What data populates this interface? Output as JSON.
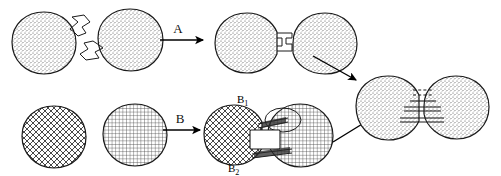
{
  "figure": {
    "background_color": "#ffffff",
    "ink_color": "#1a1a1a",
    "width": 501,
    "height": 176
  },
  "reactions": [
    {
      "id": "reaction-a",
      "arrow_label": "A",
      "row": "top",
      "reactant_left": {
        "name": "stippled-sphere-with-tab",
        "fill_pattern": "stipple",
        "appendage": "protruding-step-tab-upper-right"
      },
      "reactant_right": {
        "name": "stippled-sphere-with-tab",
        "fill_pattern": "stipple",
        "appendage": "protruding-step-tab-lower-left"
      },
      "product": {
        "name": "stippled-dimer-interlocked",
        "fill_pattern": "stipple",
        "junction": "interlocking-step-joint"
      }
    },
    {
      "id": "reaction-b",
      "arrow_label": "B",
      "row": "bottom",
      "reactant_left": {
        "name": "crosshatch-sphere",
        "fill_pattern": "diagonal-crosshatch",
        "appendage": "none"
      },
      "reactant_right": {
        "name": "grid-sphere",
        "fill_pattern": "fine-square-grid",
        "appendage": "none"
      },
      "product": {
        "name": "patterned-dimer-two-site",
        "fill_pattern": "crosshatch-and-grid",
        "junction": "two-contact-site-joint",
        "site_labels": [
          {
            "id": "site-b1",
            "text": "B",
            "subscript": "1",
            "position": "above-junction"
          },
          {
            "id": "site-b2",
            "text": "B",
            "subscript": "2",
            "position": "below-junction"
          }
        ]
      }
    }
  ],
  "final_product": {
    "name": "stippled-dimer-rod-linked",
    "fill_pattern": "stipple",
    "junction": "parallel-rod-bridge",
    "bridge_elements": [
      {
        "id": "bridge-dashed-upper",
        "style": "dashed"
      },
      {
        "id": "bridge-solid-middle",
        "style": "solid"
      },
      {
        "id": "bridge-solid-lower",
        "style": "solid"
      }
    ]
  },
  "convergence_arrows": [
    {
      "id": "arrow-from-a",
      "direction": "down-right",
      "from": "product-a",
      "to": "final-product"
    },
    {
      "id": "arrow-from-b",
      "direction": "up-right",
      "from": "product-b",
      "to": "final-product"
    }
  ]
}
